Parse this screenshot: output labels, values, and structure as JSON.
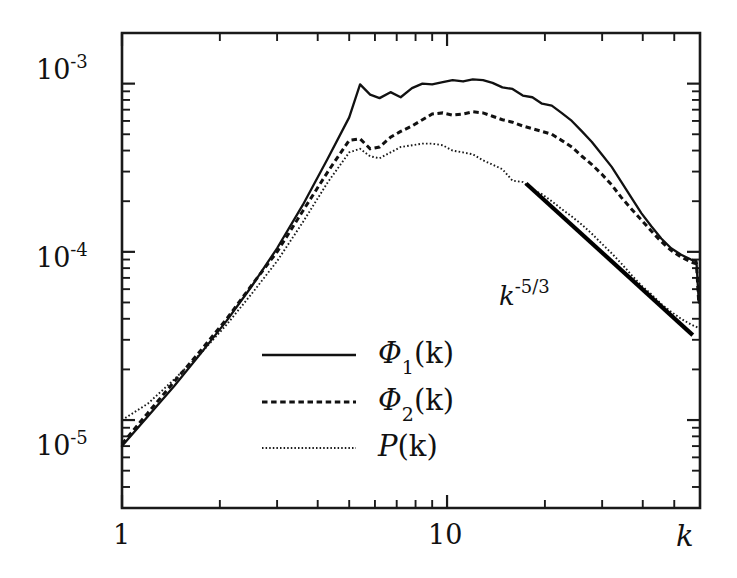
{
  "figure": {
    "background": "#ffffff",
    "ink_color": "#111111"
  },
  "chart_data": {
    "type": "line",
    "title": "",
    "subtitle": "",
    "xlabel": "k",
    "ylabel": "",
    "xscale": "log",
    "yscale": "log",
    "xlim": [
      1,
      60
    ],
    "ylim": [
      3e-06,
      0.002
    ],
    "grid": false,
    "legend_position": "center-left-inside",
    "x_tick_labels": [
      "1",
      "10"
    ],
    "x_tick_values": [
      1,
      10
    ],
    "y_tick_labels": [
      "10^-5",
      "10^-4",
      "10^-3"
    ],
    "y_tick_values": [
      1e-05,
      0.0001,
      0.001
    ],
    "y_tick_mantissas": [
      "10",
      "10",
      "10"
    ],
    "y_tick_exponents": [
      "-5",
      "-4",
      "-3"
    ],
    "annotations": [
      {
        "name": "slope-annotation",
        "base": "k",
        "exponent": "-5/3",
        "text": "k^-5/3",
        "x": 17.0,
        "y": 5.6e-05,
        "line_type": "reference-slope",
        "line_slope": -1.6667,
        "line_x_start": 17.5,
        "line_x_end": 57.0,
        "line_y_start": 0.000255,
        "line_y_end": 3.2e-05
      }
    ],
    "series": [
      {
        "name": "Phi1",
        "label": "Φ₁(k)",
        "label_base": "Φ",
        "label_sub": "1",
        "label_arg": "(k)",
        "style": "solid",
        "x": [
          1.0,
          1.2,
          1.45,
          1.75,
          2.1,
          2.5,
          3.0,
          3.6,
          4.3,
          5.0,
          5.4,
          5.8,
          6.2,
          6.7,
          7.2,
          7.8,
          8.4,
          9.0,
          9.7,
          10.4,
          11.2,
          12.0,
          12.9,
          13.8,
          14.8,
          15.9,
          17.1,
          18.3,
          19.6,
          21.0,
          22.5,
          24.2,
          26.0,
          27.9,
          29.9,
          32.1,
          34.4,
          36.9,
          39.6,
          42.5,
          45.6,
          48.9,
          52.5,
          56.3,
          58.5,
          59.5
        ],
        "y": [
          7e-06,
          1.05e-05,
          1.6e-05,
          2.5e-05,
          3.9e-05,
          6.2e-05,
          0.000105,
          0.00019,
          0.00036,
          0.00063,
          0.00099,
          0.00086,
          0.00082,
          0.00089,
          0.00083,
          0.00094,
          0.001,
          0.00099,
          0.00102,
          0.00105,
          0.00103,
          0.00106,
          0.00105,
          0.00101,
          0.00095,
          0.00093,
          0.00085,
          0.00083,
          0.00076,
          0.00074,
          0.00067,
          0.0006,
          0.00052,
          0.00045,
          0.00038,
          0.00032,
          0.00026,
          0.00021,
          0.00017,
          0.000142,
          0.00012,
          0.000105,
          9.6e-05,
          9e-05,
          8.8e-05,
          5e-05
        ]
      },
      {
        "name": "Phi2",
        "label": "Φ₂(k)",
        "label_base": "Φ",
        "label_sub": "2",
        "label_arg": "(k)",
        "style": "dashed",
        "x": [
          1.0,
          1.2,
          1.45,
          1.75,
          2.1,
          2.5,
          3.0,
          3.6,
          4.3,
          5.0,
          5.4,
          5.8,
          6.2,
          6.7,
          7.2,
          7.8,
          8.4,
          9.0,
          9.7,
          10.4,
          11.2,
          12.0,
          12.9,
          13.8,
          14.8,
          15.9,
          17.1,
          18.3,
          19.6,
          21.0,
          22.5,
          24.2,
          26.0,
          27.9,
          29.9,
          32.1,
          34.4,
          36.9,
          39.6,
          42.5,
          45.6,
          48.9,
          52.5,
          56.3,
          58.5,
          59.5
        ],
        "y": [
          7.2e-06,
          1.1e-05,
          1.7e-05,
          2.6e-05,
          4e-05,
          6.3e-05,
          0.0001,
          0.000175,
          0.0003,
          0.00046,
          0.00047,
          0.00041,
          0.00042,
          0.00048,
          0.00052,
          0.00056,
          0.00061,
          0.00066,
          0.00067,
          0.00065,
          0.00066,
          0.00068,
          0.00067,
          0.00064,
          0.00061,
          0.00059,
          0.00056,
          0.00054,
          0.00052,
          0.0005,
          0.00046,
          0.00042,
          0.00037,
          0.00033,
          0.00029,
          0.00025,
          0.00021,
          0.00018,
          0.000155,
          0.000133,
          0.000115,
          0.000102,
          9.3e-05,
          8.7e-05,
          8.5e-05,
          4.9e-05
        ]
      },
      {
        "name": "P",
        "label": "P(k)",
        "label_base": "P",
        "label_sub": "",
        "label_arg": "(k)",
        "style": "dotted",
        "x": [
          1.0,
          1.2,
          1.45,
          1.75,
          2.1,
          2.5,
          3.0,
          3.6,
          4.3,
          5.0,
          5.4,
          5.8,
          6.2,
          6.7,
          7.2,
          7.8,
          8.4,
          9.0,
          9.7,
          10.4,
          11.2,
          12.0,
          12.9,
          13.8,
          14.8,
          15.9,
          17.1,
          18.3,
          19.6,
          21.0,
          22.5,
          24.2,
          26.0,
          27.9,
          29.9,
          32.1,
          34.4,
          36.9,
          39.6,
          42.5,
          45.6,
          48.9,
          52.5,
          56.3,
          59.0
        ],
        "y": [
          1e-05,
          1.25e-05,
          1.75e-05,
          2.5e-05,
          3.7e-05,
          5.6e-05,
          8.8e-05,
          0.00015,
          0.00026,
          0.00039,
          0.00041,
          0.00037,
          0.00036,
          0.00039,
          0.00042,
          0.00043,
          0.00044,
          0.00044,
          0.00043,
          0.0004,
          0.00039,
          0.00038,
          0.00035,
          0.00033,
          0.00031,
          0.000265,
          0.00026,
          0.000235,
          0.00022,
          0.0002,
          0.00018,
          0.000162,
          0.000145,
          0.000128,
          0.000112,
          9.8e-05,
          8.5e-05,
          7.3e-05,
          6.3e-05,
          5.6e-05,
          4.9e-05,
          4.4e-05,
          4e-05,
          3.7e-05,
          3.55e-05
        ]
      }
    ]
  },
  "axes": {
    "x_label": "k",
    "y_labels": [
      {
        "mantissa": "10",
        "exponent": "-3"
      },
      {
        "mantissa": "10",
        "exponent": "-4"
      },
      {
        "mantissa": "10",
        "exponent": "-5"
      }
    ],
    "x_labels": [
      {
        "text": "1"
      },
      {
        "text": "10"
      }
    ]
  },
  "legend": {
    "entries": [
      {
        "name": "legend-phi1",
        "base": "Φ",
        "sub": "1",
        "arg": "(k)",
        "style": "solid"
      },
      {
        "name": "legend-phi2",
        "base": "Φ",
        "sub": "2",
        "arg": "(k)",
        "style": "dashed"
      },
      {
        "name": "legend-p",
        "base": "P",
        "sub": "",
        "arg": "(k)",
        "style": "dotted"
      }
    ]
  }
}
